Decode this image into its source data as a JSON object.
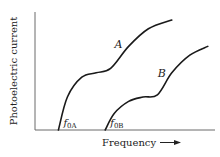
{
  "chart_data": {
    "type": "line",
    "title": "",
    "xlabel": "Frequency",
    "ylabel": "Photoelectric current",
    "x_arrow": true,
    "grid": false,
    "legend": "none",
    "series": [
      {
        "name": "A",
        "threshold_label": "f",
        "threshold_sub": "0A",
        "threshold_x": 0.13,
        "points": [
          [
            0.13,
            0.0
          ],
          [
            0.18,
            0.3
          ],
          [
            0.26,
            0.48
          ],
          [
            0.34,
            0.52
          ],
          [
            0.42,
            0.56
          ],
          [
            0.52,
            0.76
          ],
          [
            0.63,
            0.92
          ],
          [
            0.76,
            1.0
          ]
        ]
      },
      {
        "name": "B",
        "threshold_label": "f",
        "threshold_sub": "0B",
        "threshold_x": 0.39,
        "points": [
          [
            0.39,
            0.0
          ],
          [
            0.44,
            0.15
          ],
          [
            0.52,
            0.26
          ],
          [
            0.6,
            0.3
          ],
          [
            0.68,
            0.32
          ],
          [
            0.76,
            0.52
          ],
          [
            0.86,
            0.68
          ],
          [
            0.96,
            0.76
          ]
        ]
      }
    ],
    "xlim": [
      0,
      1
    ],
    "ylim": [
      0,
      1
    ]
  }
}
